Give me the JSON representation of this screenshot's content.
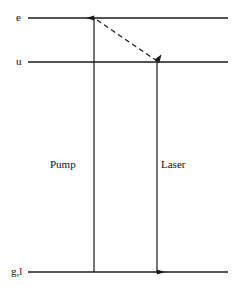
{
  "figure": {
    "kind": "energy-level-diagram",
    "background_color": "#ffffff",
    "line_color": "#1a1a1a"
  },
  "levels": [
    {
      "id": "e",
      "label": "e",
      "y": 18,
      "x_start": 28,
      "x_end": 228
    },
    {
      "id": "u",
      "label": "u",
      "y": 62,
      "x_start": 28,
      "x_end": 228
    },
    {
      "id": "gl",
      "label": "g,l",
      "y": 272,
      "x_start": 28,
      "x_end": 228
    }
  ],
  "transitions": [
    {
      "id": "pump",
      "label": "Pump",
      "style": "solid",
      "direction": "up",
      "from_level": "gl",
      "to_level": "e",
      "x": 94,
      "y_start": 272,
      "y_end": 18
    },
    {
      "id": "decay",
      "label": "",
      "style": "dashed",
      "direction": "down-right",
      "from_level": "e",
      "to_level": "u",
      "x_start": 97,
      "y_start": 20,
      "x_end": 157,
      "y_end": 61
    },
    {
      "id": "laser",
      "label": "Laser",
      "style": "solid",
      "direction": "down",
      "from_level": "u",
      "to_level": "gl",
      "x": 157,
      "y_start": 62,
      "y_end": 272
    }
  ]
}
